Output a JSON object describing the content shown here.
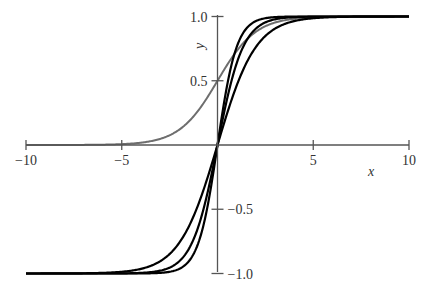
{
  "chart_data": {
    "type": "line",
    "title": "",
    "xlabel": "x",
    "ylabel": "y",
    "xlim": [
      -10,
      10
    ],
    "ylim": [
      -1.0,
      1.0
    ],
    "grid": false,
    "legend": null,
    "x_ticks": [
      {
        "value": -10,
        "label": "−10"
      },
      {
        "value": -5,
        "label": "−5"
      },
      {
        "value": 5,
        "label": "5"
      },
      {
        "value": 10,
        "label": "10"
      }
    ],
    "y_ticks": [
      {
        "value": 1.0,
        "label": "1.0"
      },
      {
        "value": 0.5,
        "label": "0.5"
      },
      {
        "value": -0.5,
        "label": "−0.5"
      },
      {
        "value": -1.0,
        "label": "−1.0"
      }
    ],
    "series": [
      {
        "name": "logistic sigmoid",
        "function": "1/(1+exp(-x))",
        "color": "#6e6e6e",
        "k": 1,
        "x": [
          -10,
          -5,
          -4,
          -3,
          -2,
          -1,
          0,
          1,
          2,
          3,
          4,
          5,
          10
        ],
        "values": [
          0.0,
          0.0067,
          0.018,
          0.047,
          0.119,
          0.269,
          0.5,
          0.731,
          0.881,
          0.953,
          0.982,
          0.993,
          1.0
        ]
      },
      {
        "name": "tanh(x)",
        "function": "tanh(1.0*x)",
        "color": "#000000",
        "k": 1.0,
        "x": [
          -10,
          -5,
          -3,
          -2,
          -1,
          0,
          1,
          2,
          3,
          5,
          10
        ],
        "values": [
          -1.0,
          -1.0,
          -0.995,
          -0.964,
          -0.762,
          0,
          0.762,
          0.964,
          0.995,
          1.0,
          1.0
        ]
      },
      {
        "name": "tanh(0.75x)",
        "function": "tanh(0.75*x)",
        "color": "#000000",
        "k": 0.75,
        "x": [
          -10,
          -5,
          -3,
          -2,
          -1,
          0,
          1,
          2,
          3,
          5,
          10
        ],
        "values": [
          -1.0,
          -0.999,
          -0.978,
          -0.905,
          -0.635,
          0,
          0.635,
          0.905,
          0.978,
          0.999,
          1.0
        ]
      },
      {
        "name": "tanh(0.5x)",
        "function": "tanh(0.5*x)",
        "color": "#000000",
        "k": 0.5,
        "x": [
          -10,
          -5,
          -3,
          -2,
          -1,
          0,
          1,
          2,
          3,
          5,
          10
        ],
        "values": [
          -1.0,
          -0.987,
          -0.905,
          -0.762,
          -0.462,
          0,
          0.462,
          0.762,
          0.905,
          0.987,
          1.0
        ]
      }
    ]
  },
  "axes": {
    "x_label": "x",
    "y_label": "y",
    "axis_color": "#555555"
  }
}
